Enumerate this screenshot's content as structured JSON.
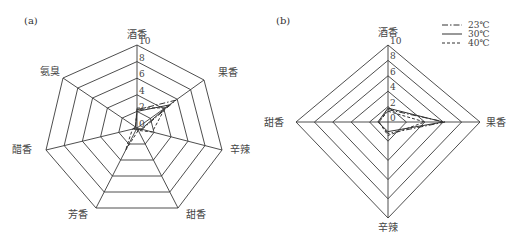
{
  "chart_data": [
    {
      "panel": "(a)",
      "type": "radar",
      "axes": [
        "酒香",
        "果香",
        "辛辣",
        "甜香",
        "芳香",
        "醋香",
        "氨臭"
      ],
      "range": [
        0,
        10
      ],
      "ticks": [
        "0",
        "2",
        "4",
        "6",
        "8",
        "10"
      ],
      "series": [
        {
          "name": "23℃",
          "style": "dashdot",
          "values": [
            2.2,
            5.8,
            0.6,
            0.3,
            0.2,
            0.4,
            0.2
          ]
        },
        {
          "name": "30℃",
          "style": "solid",
          "values": [
            2.0,
            4.8,
            0.5,
            0.2,
            0.2,
            0.3,
            0.2
          ]
        },
        {
          "name": "40℃",
          "style": "dashed",
          "values": [
            2.4,
            4.2,
            1.8,
            0.3,
            2.8,
            0.5,
            0.2
          ]
        }
      ]
    },
    {
      "panel": "(b)",
      "type": "radar",
      "axes": [
        "酒香",
        "果香",
        "辛辣",
        "甜香"
      ],
      "range": [
        0,
        10
      ],
      "ticks": [
        "0",
        "2",
        "4",
        "6",
        "8",
        "10"
      ],
      "legend": [
        "23℃",
        "30℃",
        "40℃"
      ],
      "series": [
        {
          "name": "23℃",
          "style": "dashdot",
          "values": [
            1.6,
            6.2,
            1.2,
            1.0
          ]
        },
        {
          "name": "30℃",
          "style": "solid",
          "values": [
            1.8,
            6.0,
            1.0,
            1.1
          ]
        },
        {
          "name": "40℃",
          "style": "dashed",
          "values": [
            1.4,
            4.0,
            1.4,
            1.0
          ]
        }
      ]
    }
  ]
}
